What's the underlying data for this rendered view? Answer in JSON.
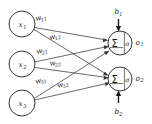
{
  "diagram": {
    "background_color": "#ffffff",
    "stroke_color": "#3a3530",
    "text_color": "#1a1a1a",
    "inputs": [
      {
        "id": "x1",
        "label": "x",
        "subscript": "1",
        "cx": 22,
        "cy": 24,
        "r": 13
      },
      {
        "id": "x2",
        "label": "x",
        "subscript": "2",
        "cx": 22,
        "cy": 64,
        "r": 13
      },
      {
        "id": "x3",
        "label": "x",
        "subscript": "3",
        "cx": 22,
        "cy": 103,
        "r": 13
      }
    ],
    "outputs": [
      {
        "id": "o1",
        "sum_symbol": "Σ",
        "activation_symbol": "σ",
        "output_label": "o",
        "output_subscript": "1",
        "bias_label": "b",
        "bias_subscript": "1",
        "bias_direction": "down",
        "cx": 120,
        "cy": 43,
        "r": 12
      },
      {
        "id": "o2",
        "sum_symbol": "Σ",
        "activation_symbol": "σ",
        "output_label": "o",
        "output_subscript": "2",
        "bias_label": "b",
        "bias_subscript": "2",
        "bias_direction": "up",
        "cx": 120,
        "cy": 79,
        "r": 12
      }
    ],
    "weights": [
      {
        "id": "w11",
        "label": "w",
        "subscript": "11",
        "from": "x1",
        "to": "o1",
        "x": 36,
        "y": 21,
        "rotate": -14
      },
      {
        "id": "w12",
        "label": "w",
        "subscript": "12",
        "from": "x1",
        "to": "o2",
        "x": 50,
        "y": 40,
        "rotate": -17
      },
      {
        "id": "w21",
        "label": "w",
        "subscript": "21",
        "from": "x2",
        "to": "o1",
        "x": 37,
        "y": 54,
        "rotate": -14
      },
      {
        "id": "w22",
        "label": "w",
        "subscript": "22",
        "from": "x2",
        "to": "o2",
        "x": 50,
        "y": 66,
        "rotate": -10
      },
      {
        "id": "w31",
        "label": "w",
        "subscript": "31",
        "from": "x3",
        "to": "o1",
        "x": 36,
        "y": 84,
        "rotate": -17
      },
      {
        "id": "w32",
        "label": "w",
        "subscript": "32",
        "from": "x3",
        "to": "o2",
        "x": 58,
        "y": 88,
        "rotate": -18
      }
    ],
    "connections": [
      {
        "from": "x1",
        "to": "o1"
      },
      {
        "from": "x1",
        "to": "o2"
      },
      {
        "from": "x2",
        "to": "o1"
      },
      {
        "from": "x2",
        "to": "o2"
      },
      {
        "from": "x3",
        "to": "o1"
      },
      {
        "from": "x3",
        "to": "o2"
      }
    ]
  }
}
